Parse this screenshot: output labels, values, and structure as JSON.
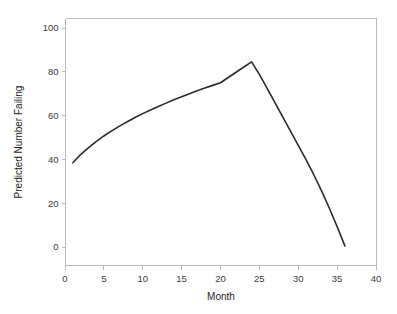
{
  "chart_data": {
    "type": "line",
    "title": "",
    "xlabel": "Month",
    "ylabel": "Predicted Number Failing",
    "xlim": [
      0,
      40
    ],
    "ylim": [
      0,
      100
    ],
    "grid": false,
    "legend": false,
    "x_ticks": [
      "0",
      "5",
      "10",
      "15",
      "20",
      "25",
      "30",
      "35",
      "40"
    ],
    "x_tick_values": [
      0,
      5,
      10,
      15,
      20,
      25,
      30,
      35,
      40
    ],
    "y_ticks": [
      "0",
      "20",
      "40",
      "60",
      "80",
      "100"
    ],
    "y_tick_values": [
      0,
      20,
      40,
      60,
      80,
      100
    ],
    "series": [
      {
        "name": "Predicted Number Failing",
        "color": "#2b2b2b",
        "x": [
          1,
          2,
          3,
          4,
          5,
          6,
          7,
          8,
          9,
          10,
          11,
          12,
          13,
          14,
          15,
          16,
          17,
          18,
          19,
          20,
          21,
          22,
          23,
          24,
          25,
          26,
          27,
          28,
          29,
          30,
          31,
          32,
          33,
          34,
          35,
          36
        ],
        "values": [
          38.5,
          42.2,
          45.3,
          48.1,
          50.7,
          53.0,
          55.2,
          57.2,
          59.1,
          60.9,
          62.6,
          64.2,
          65.7,
          67.2,
          68.6,
          70.0,
          71.3,
          72.6,
          73.8,
          75.0,
          77.4,
          79.8,
          82.2,
          84.5,
          78.8,
          72.4,
          65.9,
          59.4,
          52.9,
          46.4,
          39.9,
          33.0,
          25.6,
          17.7,
          9.3,
          0.5
        ]
      }
    ],
    "peak": {
      "x": 24,
      "y": 84.5
    },
    "start": {
      "x": 1,
      "y": 38.5
    },
    "end": {
      "x": 36,
      "y": 0.5
    }
  },
  "axes": {
    "x_title": "Month",
    "y_title": "Predicted Number Failing"
  },
  "colors": {
    "line": "#2b2b2b",
    "frame": "#b9b9b9",
    "text": "#1d1d1d",
    "background": "#ffffff"
  }
}
